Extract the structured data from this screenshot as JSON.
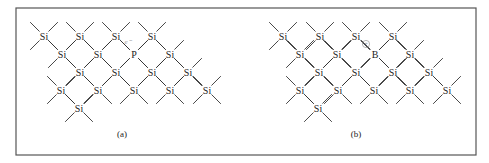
{
  "figure": {
    "frame": {
      "x": 16,
      "y": 8,
      "width": 460,
      "height": 147,
      "stroke": "#555555"
    },
    "bond_color": "#333333",
    "atom_color": "#222222",
    "annotation_color": "#999999"
  },
  "panels": [
    {
      "id": "a",
      "caption": "(a)",
      "caption_pos": {
        "x": 122,
        "y": 137
      },
      "dopant": "P",
      "atoms": [
        {
          "label": "Si",
          "x": 44,
          "y": 36,
          "bonds": [
            "ul",
            "ur",
            "dl",
            "dr"
          ]
        },
        {
          "label": "Si",
          "x": 80,
          "y": 36,
          "bonds": [
            "ul",
            "ur",
            "dl",
            "dr"
          ]
        },
        {
          "label": "Si",
          "x": 116,
          "y": 36,
          "bonds": [
            "ul",
            "ur",
            "dl",
            "dr"
          ]
        },
        {
          "label": "Si",
          "x": 152,
          "y": 36,
          "bonds": [
            "ul",
            "ur",
            "dl",
            "dr"
          ]
        },
        {
          "label": "Si",
          "x": 62,
          "y": 54,
          "bonds": [
            "ul",
            "ur",
            "dl",
            "dr"
          ]
        },
        {
          "label": "Si",
          "x": 98,
          "y": 54,
          "bonds": [
            "ul",
            "ur",
            "dl",
            "dr"
          ]
        },
        {
          "label": "P",
          "x": 134,
          "y": 54,
          "bonds": [
            "ul",
            "ur",
            "dl",
            "dr"
          ]
        },
        {
          "label": "Si",
          "x": 170,
          "y": 54,
          "bonds": [
            "ul",
            "ur",
            "dl",
            "dr"
          ]
        },
        {
          "label": "Si",
          "x": 80,
          "y": 72,
          "bonds": [
            "ul",
            "ur",
            "dl",
            "dr"
          ]
        },
        {
          "label": "Si",
          "x": 116,
          "y": 72,
          "bonds": [
            "ul",
            "ur",
            "dl",
            "dr"
          ]
        },
        {
          "label": "Si",
          "x": 152,
          "y": 72,
          "bonds": [
            "ul",
            "ur",
            "dl",
            "dr"
          ]
        },
        {
          "label": "Si",
          "x": 188,
          "y": 72,
          "bonds": [
            "ul",
            "ur",
            "dl",
            "dr"
          ]
        },
        {
          "label": "Si",
          "x": 61,
          "y": 90,
          "bonds": [
            "ul",
            "ur",
            "dl",
            "dr"
          ]
        },
        {
          "label": "Si",
          "x": 98,
          "y": 90,
          "bonds": [
            "ul",
            "ur",
            "dl",
            "dr"
          ]
        },
        {
          "label": "Si",
          "x": 134,
          "y": 90,
          "bonds": [
            "ul",
            "ur",
            "dl",
            "dr"
          ]
        },
        {
          "label": "Si",
          "x": 170,
          "y": 90,
          "bonds": [
            "ul",
            "ur",
            "dl",
            "dr"
          ]
        },
        {
          "label": "Si",
          "x": 207,
          "y": 90,
          "bonds": [
            "ul",
            "ur",
            "dl",
            "dr"
          ]
        },
        {
          "label": "Si",
          "x": 79,
          "y": 108,
          "bonds": [
            "ul",
            "ur",
            "dl",
            "dr"
          ]
        }
      ],
      "annotations": [
        {
          "kind": "electron",
          "text": "e⁻",
          "x": 128,
          "y": 44
        }
      ]
    },
    {
      "id": "b",
      "caption": "(b)",
      "caption_pos": {
        "x": 356,
        "y": 137
      },
      "dopant": "B",
      "atoms": [
        {
          "label": "Si",
          "x": 283,
          "y": 36,
          "bonds": [
            "ul",
            "ur",
            "dl",
            "dr"
          ]
        },
        {
          "label": "Si",
          "x": 320,
          "y": 36,
          "bonds": [
            "ul",
            "ur",
            "dl",
            "dr"
          ]
        },
        {
          "label": "Si",
          "x": 356,
          "y": 36,
          "bonds": [
            "ul",
            "ur",
            "dl",
            "dr"
          ]
        },
        {
          "label": "Si",
          "x": 393,
          "y": 36,
          "bonds": [
            "ul",
            "ur",
            "dl",
            "dr"
          ]
        },
        {
          "label": "Si",
          "x": 300,
          "y": 54,
          "bonds": [
            "ul",
            "ur",
            "dl",
            "dr"
          ]
        },
        {
          "label": "Si",
          "x": 337,
          "y": 54,
          "bonds": [
            "ul",
            "ur",
            "dl",
            "dr"
          ]
        },
        {
          "label": "B",
          "x": 375,
          "y": 54,
          "bonds": [
            "ul",
            "ur",
            "dl",
            "dr"
          ],
          "missing_bond": "ul"
        },
        {
          "label": "Si",
          "x": 410,
          "y": 54,
          "bonds": [
            "ul",
            "ur",
            "dl",
            "dr"
          ]
        },
        {
          "label": "Si",
          "x": 319,
          "y": 72,
          "bonds": [
            "ul",
            "ur",
            "dl",
            "dr"
          ]
        },
        {
          "label": "Si",
          "x": 356,
          "y": 72,
          "bonds": [
            "ul",
            "ur",
            "dl",
            "dr"
          ]
        },
        {
          "label": "Si",
          "x": 393,
          "y": 72,
          "bonds": [
            "ul",
            "ur",
            "dl",
            "dr"
          ]
        },
        {
          "label": "Si",
          "x": 429,
          "y": 72,
          "bonds": [
            "ul",
            "ur",
            "dl",
            "dr"
          ]
        },
        {
          "label": "Si",
          "x": 300,
          "y": 90,
          "bonds": [
            "ul",
            "ur",
            "dl",
            "dr"
          ]
        },
        {
          "label": "Si",
          "x": 338,
          "y": 90,
          "bonds": [
            "ul",
            "ur",
            "dl",
            "dr"
          ]
        },
        {
          "label": "Si",
          "x": 374,
          "y": 90,
          "bonds": [
            "ul",
            "ur",
            "dl",
            "dr"
          ]
        },
        {
          "label": "Si",
          "x": 410,
          "y": 90,
          "bonds": [
            "ul",
            "ur",
            "dl",
            "dr"
          ]
        },
        {
          "label": "Si",
          "x": 447,
          "y": 90,
          "bonds": [
            "ul",
            "ur",
            "dl",
            "dr"
          ]
        },
        {
          "label": "Si",
          "x": 318,
          "y": 108,
          "bonds": [
            "ul",
            "ur",
            "dl",
            "dr"
          ]
        }
      ],
      "annotations": [
        {
          "kind": "hole",
          "text": "+",
          "x": 366,
          "y": 44
        }
      ]
    }
  ]
}
